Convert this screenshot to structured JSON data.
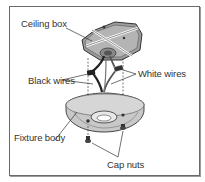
{
  "diagram": {
    "labels": {
      "ceiling_box": "Ceiling box",
      "black_wires": "Black wires",
      "white_wires": "White wires",
      "fixture_body": "Fixture body",
      "cap_nuts": "Cap nuts"
    },
    "colors": {
      "frame": "#6a6a6a",
      "box_fill": "#9c9c9c",
      "fixture_fill": "#c8c8c8",
      "line": "#333333",
      "text": "#333333"
    }
  }
}
